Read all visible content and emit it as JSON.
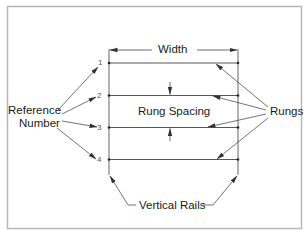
{
  "diagram": {
    "labels": {
      "width": "Width",
      "rung_spacing": "Rung Spacing",
      "rungs": "Rungs",
      "reference_line1": "Reference",
      "reference_line2": "Number",
      "vertical_rails": "Vertical Rails"
    },
    "reference_numbers": [
      "1",
      "2",
      "3",
      "4"
    ],
    "colors": {
      "line": "#3a3a3a",
      "frame": "#b8b8b8",
      "background": "#ffffff"
    }
  }
}
